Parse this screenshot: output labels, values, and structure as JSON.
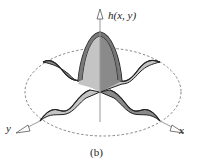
{
  "figure": {
    "caption": "(b)",
    "axes": {
      "vertical_label": "h(x, y)",
      "x_label": "x",
      "y_label": "y"
    },
    "colors": {
      "light_fill": "#c4c4c4",
      "dark_fill": "#8a8a8a",
      "mid_fill": "#a8a8a8",
      "outline": "#222222",
      "dashed_ellipse": "#666666",
      "axis": "#888888"
    }
  }
}
